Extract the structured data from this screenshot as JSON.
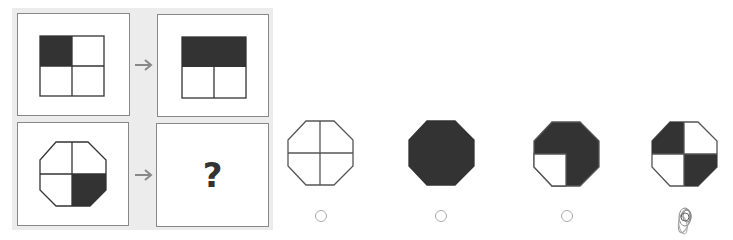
{
  "puzzle": {
    "title": "",
    "question_mark": "?",
    "colors": {
      "fill": "#333333",
      "stroke": "#333333",
      "panel_bg": "#ececec",
      "arrow": "#888888"
    },
    "example": {
      "source": {
        "shape": "square",
        "shaded_quadrants": [
          "top-left"
        ]
      },
      "target": {
        "shape": "square",
        "shaded_quadrants": [
          "top-left",
          "top-right"
        ],
        "top_merged": true
      }
    },
    "query": {
      "source": {
        "shape": "octagon",
        "shaded_quadrants": [
          "bottom-right"
        ]
      }
    }
  },
  "options": [
    {
      "id": "A",
      "shape": "octagon",
      "shaded_quadrants": [],
      "selected": false
    },
    {
      "id": "B",
      "shape": "octagon",
      "shaded_quadrants": [
        "all"
      ],
      "selected": false
    },
    {
      "id": "C",
      "shape": "octagon",
      "shaded_quadrants": [
        "top-left",
        "top-right",
        "bottom-right"
      ],
      "selected": false
    },
    {
      "id": "D",
      "shape": "octagon",
      "shaded_quadrants": [
        "top-left",
        "bottom-right"
      ],
      "selected": true,
      "scribbled": true
    }
  ]
}
